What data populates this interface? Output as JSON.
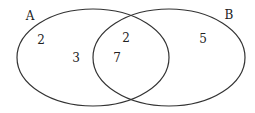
{
  "diagram": {
    "type": "venn",
    "sets": [
      {
        "name": "A",
        "label": "A"
      },
      {
        "name": "B",
        "label": "B"
      }
    ],
    "regions": {
      "a_only_top": "2",
      "a_only": "3",
      "intersection_top": "2",
      "intersection": "7",
      "b_only": "5"
    },
    "stroke_color": "#333333"
  }
}
